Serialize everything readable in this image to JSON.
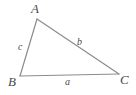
{
  "figure": {
    "type": "triangle-diagram",
    "background_color": "#ffffff",
    "stroke_color": "#8c8c8c",
    "label_color": "#4a4a4a",
    "vertices": [
      {
        "name": "A",
        "label": "A",
        "x": 37,
        "y": 19,
        "label_x": 31,
        "label_y": 2
      },
      {
        "name": "B",
        "label": "B",
        "x": 20,
        "y": 76,
        "label_x": 8,
        "label_y": 75
      },
      {
        "name": "C",
        "label": "C",
        "x": 119,
        "y": 74,
        "label_x": 120,
        "label_y": 73
      }
    ],
    "sides": [
      {
        "name": "a",
        "label": "a",
        "between": "B-C",
        "label_x": 65,
        "label_y": 77
      },
      {
        "name": "b",
        "label": "b",
        "between": "A-C",
        "label_x": 77,
        "label_y": 37
      },
      {
        "name": "c",
        "label": "c",
        "between": "A-B",
        "label_x": 18,
        "label_y": 42
      }
    ],
    "edge_paths": [
      {
        "name": "side-c-edge",
        "x1": 37,
        "y1": 19,
        "x2": 20,
        "y2": 76
      },
      {
        "name": "side-b-edge",
        "x1": 37,
        "y1": 19,
        "x2": 119,
        "y2": 74
      },
      {
        "name": "side-a-edge",
        "x1": 20,
        "y1": 76,
        "x2": 119,
        "y2": 74
      }
    ]
  }
}
